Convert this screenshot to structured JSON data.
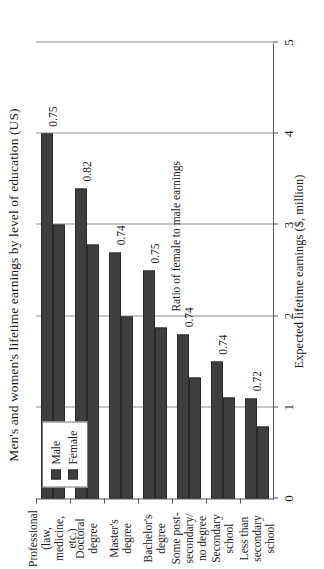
{
  "chart_data": {
    "type": "bar",
    "orientation": "horizontal-rotated",
    "title": "Men's and women's lifetime earnings by level of education (US)",
    "categories": [
      "Less than\nsecondary\nschool",
      "Secondary\nschool",
      "Some post-\nsecondary/\nno degree",
      "Bachelor's\ndegree",
      "Master's\ndegree",
      "Doctoral\ndegree",
      "Professional\n(law, medicine,\netc.)"
    ],
    "series": [
      {
        "name": "Male",
        "values": [
          1.1,
          1.5,
          1.8,
          2.5,
          2.7,
          3.4,
          4.0
        ]
      },
      {
        "name": "Female",
        "values": [
          0.79,
          1.11,
          1.33,
          1.88,
          2.0,
          2.79,
          3.0
        ]
      }
    ],
    "ratio_label": "Ratio of female to male earnings",
    "ratios": [
      0.72,
      0.74,
      0.74,
      0.75,
      0.74,
      0.82,
      0.75
    ],
    "ratio_text": [
      "0.72",
      "0.74",
      "0.74",
      "0.75",
      "0.74",
      "0.82",
      "0.75"
    ],
    "xlabel": "Expected lifetime earnings ($, million)",
    "ylabel": "Edication level",
    "ticks": [
      "0",
      "1",
      "2",
      "3",
      "4",
      "5"
    ],
    "tick_values": [
      0,
      1,
      2,
      3,
      4,
      5
    ],
    "xlim": [
      0,
      5
    ],
    "grid": true,
    "legend": {
      "position": "top-left-inside",
      "entries": [
        "Male",
        "Female"
      ]
    },
    "colors": {
      "bar": "#3f3f3f",
      "bar_edge": "#2a2a2a",
      "grid": "#8d8d8d",
      "axis": "#555555"
    }
  }
}
